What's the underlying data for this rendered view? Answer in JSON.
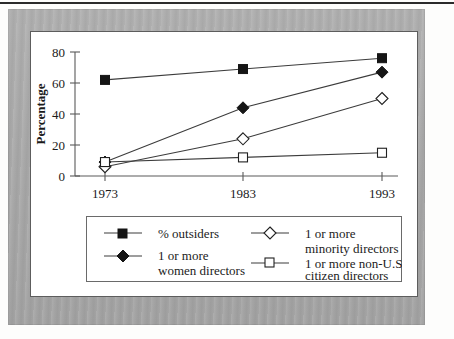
{
  "figure": {
    "panel_background": "#ffffff",
    "frame_color": "#a9a9a9",
    "rule_color": "#2b2b2b"
  },
  "chart_data": {
    "type": "line",
    "title": "",
    "xlabel": "",
    "ylabel": "Percentage",
    "x": [
      "1973",
      "1983",
      "1993"
    ],
    "categories": [
      "1973",
      "1983",
      "1993"
    ],
    "ylim": [
      0,
      80
    ],
    "yticks": [
      0,
      20,
      40,
      60,
      80
    ],
    "ytick_labels": [
      "0",
      "20",
      "40",
      "60",
      "80"
    ],
    "xtick_labels": [
      "1973",
      "1983",
      "1993"
    ],
    "grid": false,
    "legend_position": "below-plot",
    "series": [
      {
        "name": "% outsiders",
        "marker": "filled-square",
        "values": [
          62,
          69,
          76
        ]
      },
      {
        "name": "1 or more women directors",
        "marker": "filled-diamond",
        "values": [
          9,
          44,
          67
        ]
      },
      {
        "name": "1 or more minority directors",
        "marker": "open-diamond",
        "values": [
          6,
          24,
          50
        ]
      },
      {
        "name": "1 or more non-U.S. citizen directors",
        "marker": "open-square",
        "values": [
          9,
          12,
          15
        ]
      }
    ]
  },
  "axes": {
    "y_title": "Percentage",
    "y_tick_0": "0",
    "y_tick_1": "20",
    "y_tick_2": "40",
    "y_tick_3": "60",
    "y_tick_4": "80",
    "x_tick_0": "1973",
    "x_tick_1": "1983",
    "x_tick_2": "1993"
  },
  "legend": {
    "entries": [
      {
        "label_line1": "% outsiders",
        "label_line2": "",
        "marker": "filled-square"
      },
      {
        "label_line1": "1 or more",
        "label_line2": "women directors",
        "marker": "filled-diamond"
      },
      {
        "label_line1": "1 or more",
        "label_line2": "minority directors",
        "marker": "open-diamond"
      },
      {
        "label_line1": "1 or more non-U.S.",
        "label_line2": "citizen directors",
        "marker": "open-square"
      }
    ]
  }
}
